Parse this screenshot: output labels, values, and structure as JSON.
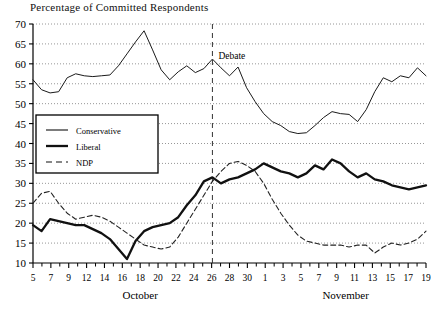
{
  "chart_data": {
    "type": "line",
    "title": "Percentage of Committed Respondents",
    "xlabel": "",
    "ylabel": "",
    "ylim": [
      10,
      70
    ],
    "ytick_step": 5,
    "yticks": [
      10,
      15,
      20,
      25,
      30,
      35,
      40,
      45,
      50,
      55,
      60,
      65,
      70
    ],
    "grid": "horizontal-dotted",
    "legend_position": "middle-left",
    "x_axis_groups": [
      {
        "label": "October",
        "ticks": [
          "5",
          "7",
          "9",
          "12",
          "14",
          "16",
          "18",
          "20",
          "22",
          "24",
          "26",
          "28",
          "30"
        ]
      },
      {
        "label": "November",
        "ticks": [
          "1",
          "3",
          "5",
          "7",
          "9",
          "11",
          "13",
          "15",
          "17",
          "19"
        ]
      }
    ],
    "xtick_labels": [
      "5",
      "7",
      "9",
      "12",
      "14",
      "16",
      "18",
      "20",
      "22",
      "24",
      "26",
      "28",
      "30",
      "1",
      "3",
      "5",
      "7",
      "9",
      "11",
      "13",
      "15",
      "17",
      "19"
    ],
    "x": [
      0,
      1,
      2,
      3,
      4,
      5,
      6,
      7,
      8,
      9,
      10,
      11,
      12,
      13,
      14,
      15,
      16,
      17,
      18,
      19,
      20,
      21,
      22,
      23,
      24,
      25,
      26,
      27,
      28,
      29,
      30,
      31,
      32,
      33,
      34,
      35,
      36,
      37,
      38,
      39,
      40,
      41,
      42,
      43,
      44,
      45,
      46
    ],
    "annotations": [
      {
        "text": "Debate",
        "x_index": 21,
        "y": 62,
        "type": "vertical-dashed-line"
      }
    ],
    "series": [
      {
        "name": "Conservative",
        "style": "thin-solid",
        "color": "#1a1a1a",
        "width": 1.0,
        "values": [
          56,
          53.5,
          52.7,
          53,
          56.5,
          57.5,
          57,
          56.8,
          57,
          57.2,
          59.5,
          62.5,
          65.5,
          68.3,
          63.5,
          58.5,
          56,
          58,
          59.5,
          57.8,
          58.8,
          61.2,
          59,
          57,
          59.2,
          54,
          50.5,
          47.5,
          45.5,
          44.5,
          43,
          42.5,
          42.7,
          44.5,
          46.5,
          48,
          47.5,
          47.3,
          45.5,
          48.5,
          53,
          56.5,
          55.5,
          57,
          56.5,
          59,
          57
        ]
      },
      {
        "name": "Liberal",
        "style": "thick-solid",
        "color": "#111111",
        "width": 2.3,
        "values": [
          19.5,
          18,
          21,
          20.5,
          20,
          19.5,
          19.5,
          18.5,
          17.5,
          16,
          13.5,
          11,
          15.5,
          18,
          19,
          19.5,
          20,
          21.5,
          24.5,
          27,
          30.5,
          31.5,
          30,
          31,
          31.5,
          32.5,
          33.5,
          35,
          34,
          33,
          32.5,
          31.5,
          32.5,
          34.5,
          33.5,
          36,
          35,
          33,
          31.5,
          32.5,
          31,
          30.5,
          29.5,
          29,
          28.5,
          29,
          29.5
        ]
      },
      {
        "name": "NDP",
        "style": "dashed",
        "color": "#222222",
        "width": 1.1,
        "values": [
          25,
          27.5,
          28,
          25,
          22.5,
          21,
          21.5,
          22,
          21.5,
          20.5,
          19,
          17.5,
          16,
          14.5,
          14,
          13.5,
          14,
          16.5,
          20,
          23.5,
          27,
          30.5,
          33,
          35,
          35.5,
          34.5,
          33,
          30,
          26,
          22.5,
          19.5,
          17,
          15.5,
          15,
          14.5,
          14.5,
          14.5,
          14,
          14.5,
          14.5,
          12.5,
          14,
          15,
          14.5,
          15,
          16,
          18
        ]
      }
    ]
  },
  "legend": {
    "items": [
      {
        "label": "Conservative",
        "swatch": "thin-solid"
      },
      {
        "label": "Liberal",
        "swatch": "thick-solid"
      },
      {
        "label": "NDP",
        "swatch": "dashed"
      }
    ]
  }
}
